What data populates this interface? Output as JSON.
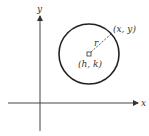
{
  "diagram": {
    "axes": {
      "x_label": "x",
      "y_label": "y"
    },
    "circle": {
      "center_label": "(h, k)",
      "point_label": "(x, y)",
      "radius_label": "r"
    },
    "colors": {
      "stroke": "#222222",
      "background": "#ffffff"
    }
  }
}
